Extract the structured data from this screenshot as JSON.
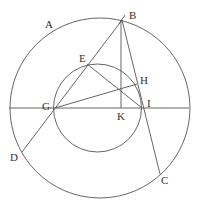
{
  "diagram": {
    "title": "",
    "colors": {
      "stroke": "#555555",
      "text": "#333333",
      "background": "#ffffff"
    },
    "outer_circle": {
      "cx": 100,
      "cy": 108,
      "r": 90
    },
    "inner_circle": {
      "cx": 97.5,
      "cy": 108,
      "r": 44
    },
    "points": {
      "A": {
        "x": 40,
        "y": 40
      },
      "B": {
        "x": 122,
        "y": 20
      },
      "C": {
        "x": 160,
        "y": 174
      },
      "D": {
        "x": 22,
        "y": 152
      },
      "E": {
        "x": 87,
        "y": 64
      },
      "G": {
        "x": 55,
        "y": 108
      },
      "H": {
        "x": 137,
        "y": 84
      },
      "I": {
        "x": 142,
        "y": 108
      },
      "K": {
        "x": 121,
        "y": 108
      }
    },
    "labels": [
      {
        "id": "A",
        "text": "A",
        "x": 45,
        "y": 28
      },
      {
        "id": "B",
        "text": "B",
        "x": 129,
        "y": 19
      },
      {
        "id": "C",
        "text": "C",
        "x": 161,
        "y": 184
      },
      {
        "id": "D",
        "text": "D",
        "x": 10,
        "y": 161
      },
      {
        "id": "E",
        "text": "E",
        "x": 79,
        "y": 62
      },
      {
        "id": "G",
        "text": "G",
        "x": 42,
        "y": 110
      },
      {
        "id": "H",
        "text": "H",
        "x": 140,
        "y": 84
      },
      {
        "id": "I",
        "text": "I",
        "x": 147,
        "y": 107
      },
      {
        "id": "K",
        "text": "K",
        "x": 117,
        "y": 120
      }
    ],
    "segments": [
      {
        "name": "diameter-line",
        "from": [
          9,
          108
        ],
        "to": [
          189,
          108
        ]
      },
      {
        "name": "line-B-D",
        "from": [
          122,
          20
        ],
        "to": [
          22,
          152
        ]
      },
      {
        "name": "line-B-C",
        "from": [
          122,
          20
        ],
        "to": [
          160,
          174
        ]
      },
      {
        "name": "line-B-K",
        "from": [
          121,
          20
        ],
        "to": [
          121,
          108
        ]
      },
      {
        "name": "line-E-I",
        "from": [
          87,
          64
        ],
        "to": [
          142,
          108
        ]
      },
      {
        "name": "line-G-H",
        "from": [
          55,
          108
        ],
        "to": [
          137,
          84
        ]
      },
      {
        "name": "tick-B",
        "from": [
          119,
          24
        ],
        "to": [
          125,
          15
        ]
      }
    ]
  }
}
